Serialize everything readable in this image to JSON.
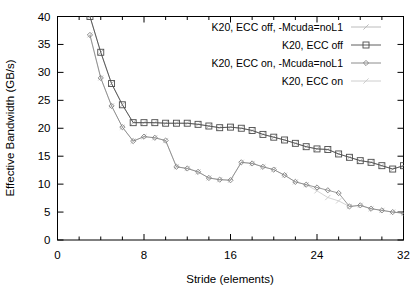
{
  "chart_data": {
    "type": "line",
    "title": "",
    "xlabel": "Stride (elements)",
    "ylabel": "Effective Bandwidth (GB/s)",
    "xlim": [
      0,
      32
    ],
    "ylim": [
      0,
      40
    ],
    "xticks": [
      0,
      8,
      16,
      24,
      32
    ],
    "xtick_labels": [
      "0",
      "8",
      "16",
      "24",
      "32"
    ],
    "xminor_ticks": [
      2,
      4,
      6,
      10,
      12,
      14,
      18,
      20,
      22,
      26,
      28,
      30
    ],
    "yticks": [
      0,
      5,
      10,
      15,
      20,
      25,
      30,
      35,
      40
    ],
    "ytick_labels": [
      "0",
      "5",
      "10",
      "15",
      "20",
      "25",
      "30",
      "35",
      "40"
    ],
    "grid": false,
    "legend_position": "top-right",
    "series": [
      {
        "name": "K20, ECC off, -Mcuda=noL1",
        "marker": "star",
        "color": "#b4b4b4",
        "x": [
          3,
          4,
          5,
          6,
          7,
          8,
          9,
          10,
          11,
          12,
          13,
          14,
          15,
          16,
          17,
          18,
          19,
          20,
          21,
          22,
          23,
          24,
          25,
          26,
          27,
          28,
          29,
          30,
          31,
          32
        ],
        "y": [
          40.0,
          33.6,
          28.0,
          24.2,
          21.0,
          21.0,
          21.0,
          20.9,
          20.9,
          20.9,
          20.7,
          20.4,
          20.1,
          20.2,
          20.0,
          19.6,
          18.9,
          18.4,
          17.9,
          17.3,
          16.7,
          16.3,
          16.2,
          15.4,
          14.8,
          14.2,
          13.9,
          13.3,
          12.7,
          13.3
        ]
      },
      {
        "name": "K20, ECC off",
        "marker": "square",
        "color": "#4d4d4d",
        "x": [
          3,
          4,
          5,
          6,
          7,
          8,
          9,
          10,
          11,
          12,
          13,
          14,
          15,
          16,
          17,
          18,
          19,
          20,
          21,
          22,
          23,
          24,
          25,
          26,
          27,
          28,
          29,
          30,
          31,
          32
        ],
        "y": [
          40.0,
          33.6,
          28.0,
          24.2,
          21.0,
          21.0,
          21.0,
          20.9,
          20.9,
          20.9,
          20.7,
          20.4,
          20.1,
          20.2,
          20.0,
          19.6,
          18.9,
          18.4,
          17.9,
          17.3,
          16.7,
          16.3,
          16.2,
          15.4,
          14.8,
          14.2,
          13.9,
          13.3,
          12.7,
          13.3
        ]
      },
      {
        "name": "K20, ECC on, -Mcuda=noL1",
        "marker": "diamond",
        "color": "#808080",
        "x": [
          3,
          4,
          5,
          6,
          7,
          8,
          9,
          10,
          11,
          12,
          13,
          14,
          15,
          16,
          17,
          18,
          19,
          20,
          21,
          22,
          23,
          24,
          25,
          26,
          27,
          28,
          29,
          30,
          31,
          32
        ],
        "y": [
          36.7,
          29.0,
          24.0,
          20.2,
          17.7,
          18.5,
          18.3,
          17.8,
          13.1,
          12.8,
          12.2,
          11.1,
          10.8,
          10.7,
          13.9,
          13.7,
          13.1,
          12.6,
          11.6,
          10.4,
          9.9,
          9.4,
          8.9,
          8.4,
          6.0,
          6.2,
          5.6,
          5.3,
          5.0,
          4.8
        ]
      },
      {
        "name": "K20, ECC on",
        "marker": "star",
        "color": "#c8c8c8",
        "x": [
          3,
          4,
          5,
          6,
          7,
          8,
          9,
          10,
          11,
          12,
          13,
          14,
          15,
          16,
          17,
          18,
          19,
          20,
          21,
          22,
          23,
          24,
          25,
          26,
          27,
          28,
          29,
          30,
          31,
          32
        ],
        "y": [
          36.7,
          29.0,
          24.0,
          20.2,
          17.7,
          18.5,
          18.3,
          17.8,
          13.1,
          12.8,
          12.2,
          11.1,
          10.8,
          10.7,
          13.9,
          13.7,
          13.1,
          12.6,
          11.6,
          10.4,
          9.9,
          8.8,
          7.6,
          7.0,
          6.0,
          6.2,
          5.6,
          5.3,
          5.0,
          4.8
        ]
      }
    ]
  },
  "axes": {
    "y_title": "Effective Bandwidth (GB/s)",
    "x_title": "Stride (elements)",
    "y_labels": [
      "40",
      "35",
      "30",
      "25",
      "20",
      "15",
      "10",
      "5",
      "0"
    ],
    "x_labels": [
      "0",
      "8",
      "16",
      "24",
      "32"
    ]
  },
  "legend": {
    "entries": [
      {
        "label": "K20, ECC off, -Mcuda=noL1",
        "marker": "star-icon",
        "color": "#b4b4b4"
      },
      {
        "label": "K20, ECC off",
        "marker": "square-icon",
        "color": "#4d4d4d"
      },
      {
        "label": "K20, ECC on, -Mcuda=noL1",
        "marker": "diamond-icon",
        "color": "#808080"
      },
      {
        "label": "K20, ECC on",
        "marker": "star-icon",
        "color": "#c8c8c8"
      }
    ]
  }
}
